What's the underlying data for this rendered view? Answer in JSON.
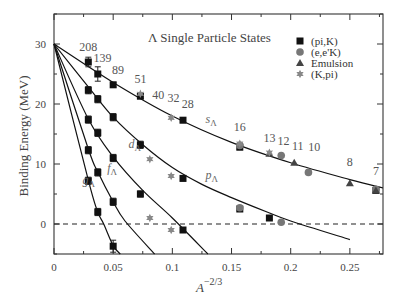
{
  "chart_data": {
    "type": "scatter",
    "title": "Λ Single Particle States",
    "xlabel": "A^{-2/3}",
    "ylabel": "Binding Energy (MeV)",
    "xlim": [
      0,
      0.278
    ],
    "ylim": [
      -5,
      35
    ],
    "x_ticks": [
      0,
      0.05,
      0.1,
      0.15,
      0.2,
      0.25
    ],
    "x_tick_labels": [
      "0",
      "0.05",
      "0.1",
      "0.15",
      "0.2",
      "0.25"
    ],
    "y_ticks": [
      0,
      10,
      20,
      30
    ],
    "y_tick_labels": [
      "0",
      "10",
      "20",
      "30"
    ],
    "grid": false,
    "reference_line": {
      "y": 0,
      "style": "dashed"
    },
    "legend_position": "upper right",
    "legend": [
      {
        "label": "(pi,K)",
        "marker": "square",
        "color": "#111111"
      },
      {
        "label": "(e,e'K)",
        "marker": "circle",
        "color": "#777777"
      },
      {
        "label": "Emulsion",
        "marker": "triangle",
        "color": "#444444"
      },
      {
        "label": "(K,pi)",
        "marker": "star",
        "color": "#888888"
      }
    ],
    "mass_labels": [
      {
        "text": "208",
        "x": 0.029,
        "y": 28.8
      },
      {
        "text": "139",
        "x": 0.041,
        "y": 27.0
      },
      {
        "text": "89",
        "x": 0.054,
        "y": 25.0
      },
      {
        "text": "51",
        "x": 0.073,
        "y": 23.5
      },
      {
        "text": "40",
        "x": 0.088,
        "y": 20.9
      },
      {
        "text": "32",
        "x": 0.101,
        "y": 20.4
      },
      {
        "text": "28",
        "x": 0.113,
        "y": 19.4
      },
      {
        "text": "16",
        "x": 0.157,
        "y": 15.5
      },
      {
        "text": "13",
        "x": 0.182,
        "y": 13.7
      },
      {
        "text": "12",
        "x": 0.194,
        "y": 13.2
      },
      {
        "text": "11",
        "x": 0.206,
        "y": 12.4
      },
      {
        "text": "10",
        "x": 0.22,
        "y": 12.1
      },
      {
        "text": "8",
        "x": 0.25,
        "y": 9.6
      },
      {
        "text": "7",
        "x": 0.272,
        "y": 8.2
      }
    ],
    "shell_labels": [
      {
        "text": "s",
        "sub": "Λ",
        "x": 0.128,
        "y": 16.8
      },
      {
        "text": "p",
        "sub": "Λ",
        "x": 0.128,
        "y": 7.5
      },
      {
        "text": "d",
        "sub": "Λ",
        "x": 0.063,
        "y": 12.6
      },
      {
        "text": "f",
        "sub": "Λ",
        "x": 0.045,
        "y": 8.6
      },
      {
        "text": "g",
        "sub": "Λ",
        "x": 0.024,
        "y": 6.7
      }
    ],
    "curves": [
      {
        "name": "s_Λ",
        "points": [
          [
            0,
            30
          ],
          [
            0.05,
            23.6
          ],
          [
            0.1,
            18.0
          ],
          [
            0.15,
            13.6
          ],
          [
            0.2,
            10.2
          ],
          [
            0.25,
            7.4
          ],
          [
            0.278,
            6.0
          ]
        ]
      },
      {
        "name": "p_Λ",
        "points": [
          [
            0,
            30
          ],
          [
            0.03,
            22.6
          ],
          [
            0.05,
            17.8
          ],
          [
            0.075,
            13.2
          ],
          [
            0.1,
            9.4
          ],
          [
            0.125,
            6.6
          ],
          [
            0.15,
            4.4
          ],
          [
            0.18,
            2.0
          ],
          [
            0.2,
            0.5
          ],
          [
            0.25,
            -2.6
          ]
        ]
      },
      {
        "name": "d_Λ",
        "points": [
          [
            0,
            30
          ],
          [
            0.029,
            17.5
          ],
          [
            0.05,
            11.2
          ],
          [
            0.075,
            5.6
          ],
          [
            0.1,
            1.0
          ],
          [
            0.13,
            -5.0
          ]
        ]
      },
      {
        "name": "f_Λ",
        "points": [
          [
            0,
            30
          ],
          [
            0.029,
            12.5
          ],
          [
            0.037,
            8.7
          ],
          [
            0.05,
            3.7
          ],
          [
            0.06,
            0.5
          ],
          [
            0.085,
            -5.0
          ]
        ]
      },
      {
        "name": "g_Λ",
        "points": [
          [
            0,
            30
          ],
          [
            0.029,
            7.3
          ],
          [
            0.037,
            2.0
          ],
          [
            0.042,
            0.0
          ],
          [
            0.05,
            -3.6
          ],
          [
            0.056,
            -5.0
          ]
        ]
      }
    ],
    "series": [
      {
        "name": "(pi,K)",
        "marker": "square",
        "points": [
          {
            "shell": "s",
            "A": 208,
            "x": 0.029,
            "y": 27.0,
            "err": 0.8
          },
          {
            "shell": "s",
            "A": 139,
            "x": 0.037,
            "y": 25.0,
            "err": 1.2
          },
          {
            "shell": "s",
            "A": 89,
            "x": 0.05,
            "y": 23.2,
            "err": 0.4
          },
          {
            "shell": "s",
            "A": 51,
            "x": 0.073,
            "y": 21.3,
            "err": 0.4
          },
          {
            "shell": "s",
            "A": 28,
            "x": 0.109,
            "y": 17.3,
            "err": 0.4
          },
          {
            "shell": "s",
            "A": 16,
            "x": 0.157,
            "y": 12.8,
            "err": 0.4
          },
          {
            "shell": "s",
            "A": 7,
            "x": 0.272,
            "y": 5.6,
            "err": 0.3
          },
          {
            "shell": "p",
            "A": 208,
            "x": 0.029,
            "y": 22.3,
            "err": 0.6
          },
          {
            "shell": "p",
            "A": 139,
            "x": 0.037,
            "y": 20.8,
            "err": 0.6
          },
          {
            "shell": "p",
            "A": 89,
            "x": 0.05,
            "y": 17.8,
            "err": 0.6
          },
          {
            "shell": "p",
            "A": 51,
            "x": 0.073,
            "y": 13.2,
            "err": 0.6
          },
          {
            "shell": "p",
            "A": 28,
            "x": 0.109,
            "y": 7.6,
            "err": 0.4
          },
          {
            "shell": "p",
            "A": 16,
            "x": 0.157,
            "y": 2.5,
            "err": 0.3
          },
          {
            "shell": "p",
            "A": 12,
            "x": 0.182,
            "y": 1.0,
            "err": 0.2
          },
          {
            "shell": "d",
            "A": 208,
            "x": 0.029,
            "y": 17.4,
            "err": 0.6
          },
          {
            "shell": "d",
            "A": 139,
            "x": 0.037,
            "y": 15.2,
            "err": 0.6
          },
          {
            "shell": "d",
            "A": 89,
            "x": 0.05,
            "y": 11.0,
            "err": 0.6
          },
          {
            "shell": "d",
            "A": 51,
            "x": 0.073,
            "y": 5.0,
            "err": 0.5
          },
          {
            "shell": "d",
            "A": 28,
            "x": 0.109,
            "y": -1.0,
            "err": 0.4
          },
          {
            "shell": "f",
            "A": 208,
            "x": 0.029,
            "y": 12.3,
            "err": 0.6
          },
          {
            "shell": "f",
            "A": 139,
            "x": 0.037,
            "y": 8.6,
            "err": 0.6
          },
          {
            "shell": "f",
            "A": 89,
            "x": 0.05,
            "y": 3.7,
            "err": 0.6
          },
          {
            "shell": "g",
            "A": 208,
            "x": 0.029,
            "y": 7.2,
            "err": 0.6
          },
          {
            "shell": "g",
            "A": 139,
            "x": 0.037,
            "y": 2.0,
            "err": 0.6
          },
          {
            "shell": "g",
            "A": 89,
            "x": 0.05,
            "y": -3.7,
            "err": 1.0
          }
        ]
      },
      {
        "name": "(e,e'K)",
        "marker": "circle",
        "points": [
          {
            "shell": "s",
            "A": 16,
            "x": 0.157,
            "y": 13.1
          },
          {
            "shell": "s",
            "A": 12,
            "x": 0.192,
            "y": 11.4
          },
          {
            "shell": "s",
            "A": 10,
            "x": 0.215,
            "y": 8.6
          },
          {
            "shell": "s",
            "A": 7,
            "x": 0.272,
            "y": 5.8
          },
          {
            "shell": "p",
            "A": 16,
            "x": 0.157,
            "y": 2.7
          },
          {
            "shell": "p",
            "A": 12,
            "x": 0.192,
            "y": 0.3
          }
        ]
      },
      {
        "name": "Emulsion",
        "marker": "triangle",
        "points": [
          {
            "shell": "s",
            "A": 13,
            "x": 0.182,
            "y": 11.7
          },
          {
            "shell": "s",
            "A": 11,
            "x": 0.203,
            "y": 10.2
          },
          {
            "shell": "s",
            "A": 8,
            "x": 0.25,
            "y": 6.8
          },
          {
            "shell": "s",
            "A": 7,
            "x": 0.272,
            "y": 5.6
          }
        ]
      },
      {
        "name": "(K,pi)",
        "marker": "star",
        "points": [
          {
            "shell": "s",
            "A": 51,
            "x": 0.073,
            "y": 21.7
          },
          {
            "shell": "s",
            "A": 40,
            "x": 0.099,
            "y": 17.7
          },
          {
            "shell": "s",
            "A": 16,
            "x": 0.157,
            "y": 13.4
          },
          {
            "shell": "s",
            "A": 13,
            "x": 0.182,
            "y": 11.9
          },
          {
            "shell": "p",
            "A": 40,
            "x": 0.081,
            "y": 10.8
          },
          {
            "shell": "p",
            "A": 32,
            "x": 0.099,
            "y": 8.0
          },
          {
            "shell": "d",
            "A": 40,
            "x": 0.081,
            "y": 1.0
          },
          {
            "shell": "d",
            "A": 32,
            "x": 0.099,
            "y": -1.0
          }
        ]
      }
    ]
  }
}
